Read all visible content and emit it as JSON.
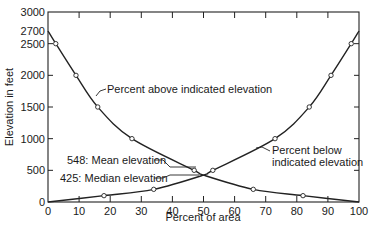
{
  "chart_data": {
    "type": "line",
    "title": "",
    "xlabel": "Percent of area",
    "ylabel": "Elevation in feet",
    "xlim": [
      0,
      100
    ],
    "ylim": [
      0,
      3000
    ],
    "x_ticks": [
      "0",
      "10",
      "20",
      "30",
      "40",
      "50",
      "60",
      "70",
      "80",
      "90",
      "100"
    ],
    "y_ticks": [
      "0",
      "500",
      "1000",
      "1500",
      "2000",
      "2500",
      "2700",
      "3000"
    ],
    "grid": false,
    "legend": "none",
    "series": [
      {
        "name": "Percent above indicated elevation",
        "points": [
          [
            0,
            2700
          ],
          [
            2.5,
            2500
          ],
          [
            9,
            2000
          ],
          [
            16,
            1500
          ],
          [
            27,
            1000
          ],
          [
            47,
            500
          ],
          [
            50,
            425
          ],
          [
            66,
            200
          ],
          [
            82,
            100
          ],
          [
            100,
            0
          ]
        ]
      },
      {
        "name": "Percent below indicated elevation",
        "points": [
          [
            0,
            0
          ],
          [
            18,
            100
          ],
          [
            34,
            200
          ],
          [
            50,
            425
          ],
          [
            53,
            500
          ],
          [
            73,
            1000
          ],
          [
            84,
            1500
          ],
          [
            91,
            2000
          ],
          [
            97.5,
            2500
          ],
          [
            100,
            2700
          ]
        ]
      }
    ],
    "annotations": [
      {
        "text": "Percent above indicated elevation",
        "x": 16,
        "y": 1400
      },
      {
        "text": "Percent below indicated elevation",
        "x": 76,
        "y": 800
      },
      {
        "text": "548: Mean elevation",
        "value": 548
      },
      {
        "text": "425: Median elevation",
        "value": 425
      }
    ]
  },
  "labels": {
    "xlabel": "Percent of area",
    "ylabel": "Elevation in feet",
    "above": "Percent above indicated elevation",
    "below_line1": "Percent below",
    "below_line2": "indicated elevation",
    "mean": "548: Mean elevation",
    "median": "425: Median elevation"
  }
}
